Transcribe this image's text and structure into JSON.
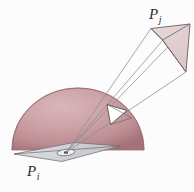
{
  "figure": {
    "title_label_upper": "P",
    "title_label_upper_sub": "j",
    "title_label_lower": "P",
    "title_label_lower_sub": "i",
    "colors": {
      "background": "#fdfcfc",
      "dome_light": "#d8b3b6",
      "dome_mid": "#c89aa0",
      "dome_dark": "#9e6a70",
      "patch_fill": "#e2d0d1",
      "patch_stroke": "#6b5f63",
      "ray_stroke": "#8a8a93",
      "base_plane_fill": "#d9dade",
      "base_plane_stroke": "#6f7076",
      "white_patch_fill": "#ffffff",
      "label_color": "#2b2b2b"
    },
    "geometry": {
      "dome_center_x": 78,
      "dome_center_y": 150,
      "dome_radius_x": 66,
      "dome_radius_y": 62,
      "base_plane_points": "14,154 74,143 120,146 62,161",
      "white_patch_points": "108,105 126,110 110,124",
      "upper_patch_points": "151,28 190,24 186,72 163,40",
      "convergence_point_x": 66,
      "convergence_point_y": 153,
      "rays": [
        {
          "from_x": 66,
          "from_y": 153,
          "to_x": 151,
          "to_y": 28
        },
        {
          "from_x": 66,
          "from_y": 153,
          "to_x": 190,
          "to_y": 24
        },
        {
          "from_x": 66,
          "from_y": 153,
          "to_x": 186,
          "to_y": 72
        },
        {
          "from_x": 66,
          "from_y": 153,
          "to_x": 163,
          "to_y": 40
        }
      ]
    }
  }
}
